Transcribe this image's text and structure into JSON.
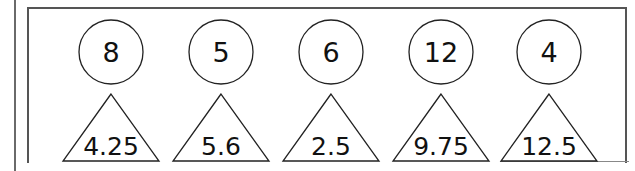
{
  "pairs": [
    {
      "circle": "8",
      "triangle": "4.25"
    },
    {
      "circle": "5",
      "triangle": "5.6"
    },
    {
      "circle": "6",
      "triangle": "2.5"
    },
    {
      "circle": "12",
      "triangle": "9.75"
    },
    {
      "circle": "4",
      "triangle": "12.5"
    }
  ]
}
